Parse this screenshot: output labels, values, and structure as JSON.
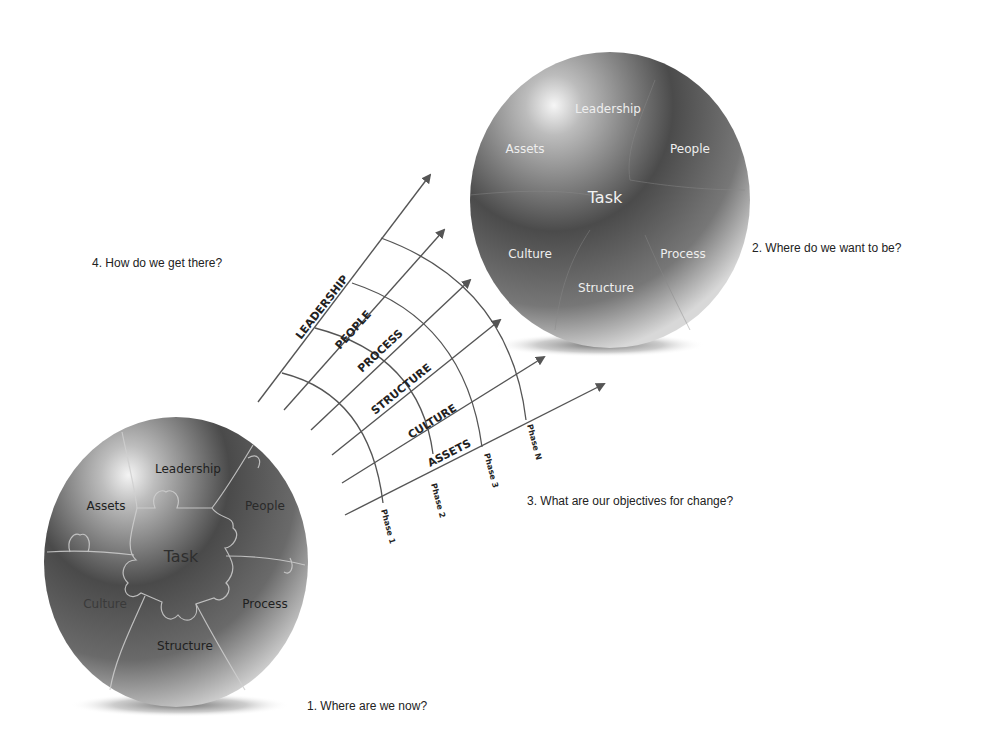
{
  "questions": {
    "q1": "1.  Where are we now?",
    "q2": "2.  Where do we want to be?",
    "q3": "3.  What are our objectives for change?",
    "q4": "4.  How do we get there?"
  },
  "current_sphere": {
    "center": "Task",
    "segments": [
      "Leadership",
      "People",
      "Process",
      "Structure",
      "Culture",
      "Assets"
    ]
  },
  "target_sphere": {
    "center": "Task",
    "segments": [
      "Leadership",
      "People",
      "Process",
      "Structure",
      "Culture",
      "Assets"
    ]
  },
  "arrows": [
    {
      "label": "LEADERSHIP"
    },
    {
      "label": "PEOPLE"
    },
    {
      "label": "PROCESS"
    },
    {
      "label": "STRUCTURE"
    },
    {
      "label": "CULTURE"
    },
    {
      "label": "ASSETS"
    }
  ],
  "phases": [
    "Phase 1",
    "Phase 2",
    "Phase 3",
    "Phase N"
  ],
  "colors": {
    "line": "#555555",
    "sphere_dark": "#2a2a2a",
    "sphere_light": "#e8e8e8",
    "text": "#222222"
  }
}
